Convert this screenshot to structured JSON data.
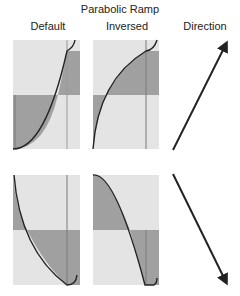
{
  "title": "Parabolic Ramp",
  "columns": {
    "default": "Default",
    "inversed": "Inversed",
    "direction": "Direction"
  },
  "colors": {
    "panel_light": "#e4e4e4",
    "panel_dark": "#a0a0a0",
    "curve": "#222222",
    "marker_line": "#7a7a7a"
  },
  "rows": [
    {
      "name": "rising",
      "direction": "up"
    },
    {
      "name": "falling",
      "direction": "down"
    }
  ]
}
